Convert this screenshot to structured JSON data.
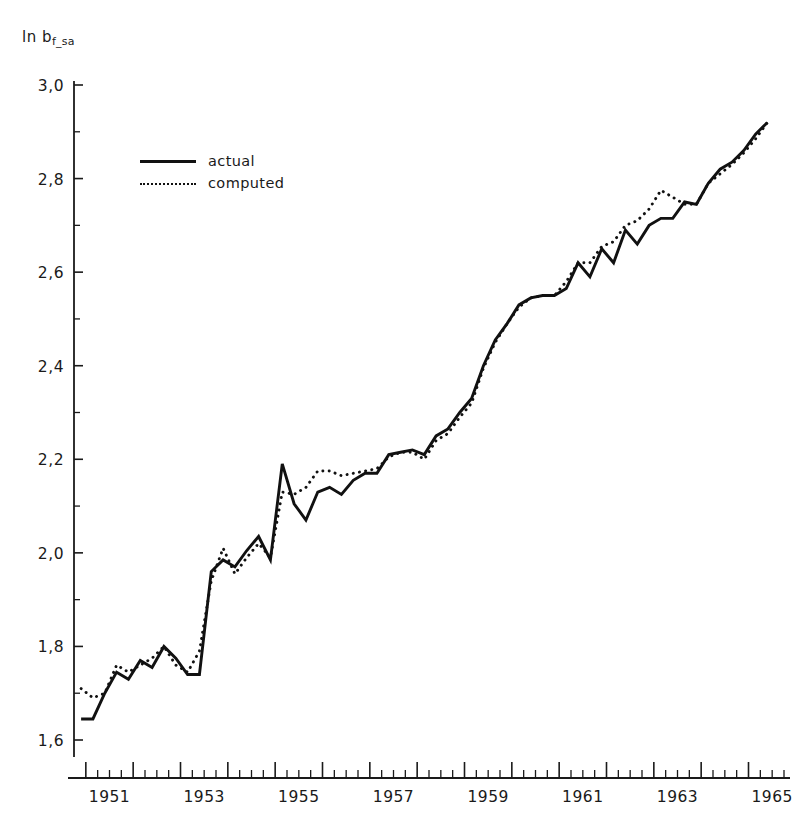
{
  "figure": {
    "top_cropped_text": "",
    "y_axis_label_main": "ln b",
    "y_axis_label_sub": "f_sa"
  },
  "legend": {
    "position": "top-left-inside",
    "items": [
      {
        "label": "actual",
        "style": "solid",
        "key": "legend-key-actual"
      },
      {
        "label": "computed",
        "style": "dotted",
        "key": "legend-key-computed"
      }
    ]
  },
  "chart_data": {
    "type": "line",
    "title": "",
    "subtitle": "",
    "xlabel": "",
    "ylabel": "ln b_f_sa",
    "xlim": [
      1950.75,
      1965.75
    ],
    "ylim": [
      1.6,
      3.0
    ],
    "grid": false,
    "legend_position": "upper left",
    "y_ticks": [
      1.6,
      1.8,
      2.0,
      2.2,
      2.4,
      2.6,
      2.8,
      3.0
    ],
    "y_tick_labels": [
      "1,6",
      "1,8",
      "2,0",
      "2,2",
      "2,4",
      "2,6",
      "2,8",
      "3,0"
    ],
    "y_minor_ticks": [
      1.7,
      1.9,
      2.1,
      2.3,
      2.5,
      2.7,
      2.9
    ],
    "x_ticks": [
      1951,
      1953,
      1955,
      1957,
      1959,
      1961,
      1963,
      1965
    ],
    "x_tick_labels": [
      "1951",
      "1953",
      "1955",
      "1957",
      "1959",
      "1961",
      "1963",
      "1965"
    ],
    "x_minor_tick_interval_years": 0.25,
    "x_year_tick_start": 1951,
    "x_year_tick_end": 1966,
    "x_data_start": 1950.9,
    "series": [
      {
        "name": "actual",
        "style": "solid",
        "color": "#111111",
        "x": [
          1950.9,
          1951.15,
          1951.4,
          1951.65,
          1951.9,
          1952.15,
          1952.4,
          1952.65,
          1952.9,
          1953.15,
          1953.4,
          1953.65,
          1953.9,
          1954.15,
          1954.4,
          1954.65,
          1954.9,
          1955.15,
          1955.4,
          1955.65,
          1955.9,
          1956.15,
          1956.4,
          1956.65,
          1956.9,
          1957.15,
          1957.4,
          1957.65,
          1957.9,
          1958.15,
          1958.4,
          1958.65,
          1958.9,
          1959.15,
          1959.4,
          1959.65,
          1959.9,
          1960.15,
          1960.4,
          1960.65,
          1960.9,
          1961.15,
          1961.4,
          1961.65,
          1961.9,
          1962.15,
          1962.4,
          1962.65,
          1962.9,
          1963.15,
          1963.4,
          1963.65,
          1963.9,
          1964.15,
          1964.4,
          1964.65,
          1964.9,
          1965.15,
          1965.4
        ],
        "y": [
          1.645,
          1.645,
          1.7,
          1.745,
          1.73,
          1.77,
          1.755,
          1.8,
          1.775,
          1.74,
          1.74,
          1.96,
          1.985,
          1.97,
          2.005,
          2.035,
          1.985,
          2.19,
          2.105,
          2.07,
          2.13,
          2.14,
          2.125,
          2.155,
          2.17,
          2.17,
          2.21,
          2.215,
          2.22,
          2.21,
          2.25,
          2.265,
          2.3,
          2.33,
          2.4,
          2.455,
          2.49,
          2.53,
          2.545,
          2.55,
          2.55,
          2.565,
          2.62,
          2.59,
          2.65,
          2.62,
          2.69,
          2.66,
          2.7,
          2.715,
          2.715,
          2.75,
          2.745,
          2.79,
          2.82,
          2.835,
          2.86,
          2.895,
          2.92
        ]
      },
      {
        "name": "computed",
        "style": "dotted",
        "color": "#111111",
        "x": [
          1950.9,
          1951.15,
          1951.4,
          1951.65,
          1951.9,
          1952.15,
          1952.4,
          1952.65,
          1952.9,
          1953.15,
          1953.4,
          1953.65,
          1953.9,
          1954.15,
          1954.4,
          1954.65,
          1954.9,
          1955.15,
          1955.4,
          1955.65,
          1955.9,
          1956.15,
          1956.4,
          1956.65,
          1956.9,
          1957.15,
          1957.4,
          1957.65,
          1957.9,
          1958.15,
          1958.4,
          1958.65,
          1958.9,
          1959.15,
          1959.4,
          1959.65,
          1959.9,
          1960.15,
          1960.4,
          1960.65,
          1960.9,
          1961.15,
          1961.4,
          1961.65,
          1961.9,
          1962.15,
          1962.4,
          1962.65,
          1962.9,
          1963.15,
          1963.4,
          1963.65,
          1963.9,
          1964.15,
          1964.4,
          1964.65,
          1964.9,
          1965.15,
          1965.4
        ],
        "y": [
          1.71,
          1.69,
          1.7,
          1.76,
          1.745,
          1.76,
          1.775,
          1.8,
          1.76,
          1.745,
          1.79,
          1.94,
          2.01,
          1.955,
          1.99,
          2.02,
          1.99,
          2.13,
          2.125,
          2.14,
          2.175,
          2.175,
          2.165,
          2.17,
          2.175,
          2.18,
          2.205,
          2.215,
          2.215,
          2.2,
          2.24,
          2.255,
          2.29,
          2.32,
          2.395,
          2.45,
          2.49,
          2.525,
          2.545,
          2.55,
          2.55,
          2.58,
          2.62,
          2.62,
          2.655,
          2.665,
          2.7,
          2.71,
          2.735,
          2.775,
          2.76,
          2.745,
          2.745,
          2.79,
          2.81,
          2.83,
          2.855,
          2.885,
          2.92
        ]
      }
    ]
  }
}
